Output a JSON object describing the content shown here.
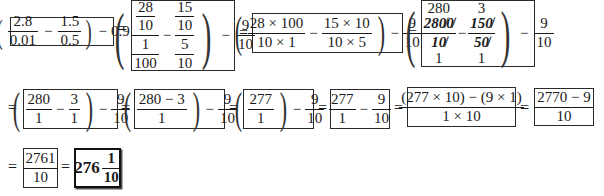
{
  "steps": {
    "s1": {
      "a_num": "2.8",
      "a_den": "0.01",
      "b_num": "1.5",
      "b_den": "0.5",
      "tail": "0.9",
      "minus": "−"
    },
    "s2": {
      "a_top_num": "28",
      "a_top_den": "10",
      "a_bot_num": "1",
      "a_bot_den": "100",
      "b_top_num": "15",
      "b_top_den": "10",
      "b_bot_num": "5",
      "b_bot_den": "10",
      "c_num": "9",
      "c_den": "10",
      "minus": "−"
    },
    "s3": {
      "a_num": "28 × 100",
      "a_den": "10 × 1",
      "b_num": "15 × 10",
      "b_den": "10 × 5",
      "c_num": "9",
      "c_den": "10",
      "minus": "−"
    },
    "s4": {
      "a_reduced_num": "280",
      "a_num": "2800",
      "a_den": "10",
      "a_reduced_den": "1",
      "b_reduced_num": "3",
      "b_num": "150",
      "b_den": "50",
      "b_reduced_den": "1",
      "c_num": "9",
      "c_den": "10",
      "minus": "−"
    },
    "s5": {
      "a_num": "280",
      "a_den": "1",
      "b_num": "3",
      "b_den": "1",
      "c_num": "9",
      "c_den": "10",
      "minus": "−"
    },
    "s6": {
      "a_num": "280 − 3",
      "a_den": "1",
      "c_num": "9",
      "c_den": "10",
      "minus": "−"
    },
    "s7": {
      "a_num": "277",
      "a_den": "1",
      "c_num": "9",
      "c_den": "10",
      "minus": "−"
    },
    "s8": {
      "a_num": "277",
      "a_den": "1",
      "c_num": "9",
      "c_den": "10",
      "minus": "−"
    },
    "s9": {
      "num": "(277 × 10) − (9 × 1)",
      "den": "1 × 10"
    },
    "s10": {
      "num": "2770 − 9",
      "den": "10"
    },
    "s11": {
      "num": "2761",
      "den": "10"
    },
    "answer": {
      "whole": "276",
      "num": "1",
      "den": "10"
    }
  },
  "equals": "="
}
